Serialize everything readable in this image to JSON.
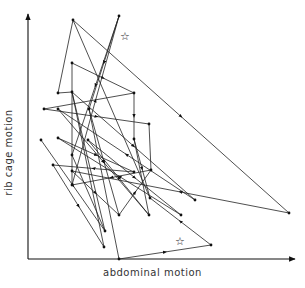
{
  "figure": {
    "x_axis_label": "abdominal motion",
    "y_axis_label": "rib cage motion",
    "star_markers": [
      {
        "x": 125,
        "y": 37,
        "symbol": "☆"
      },
      {
        "x": 180,
        "y": 242,
        "symbol": "☆"
      }
    ],
    "axes": {
      "origin": [
        28,
        259
      ],
      "x_end": [
        295,
        259
      ],
      "y_end": [
        28,
        14
      ]
    },
    "nodes": {
      "A": [
        73,
        20
      ],
      "B": [
        119,
        16
      ],
      "C": [
        58,
        93
      ],
      "D": [
        72,
        63
      ],
      "E": [
        72,
        92
      ],
      "F": [
        134,
        93
      ],
      "G": [
        44,
        109
      ],
      "H": [
        58,
        109
      ],
      "I": [
        89,
        109
      ],
      "J": [
        149,
        124
      ],
      "K": [
        41,
        140
      ],
      "L": [
        58,
        138
      ],
      "M": [
        88,
        140
      ],
      "N": [
        134,
        139
      ],
      "O": [
        53,
        165
      ],
      "P": [
        72,
        155
      ],
      "Q": [
        72,
        171
      ],
      "R": [
        134,
        172
      ],
      "S": [
        151,
        170
      ],
      "T": [
        72,
        185
      ],
      "U": [
        150,
        198
      ],
      "V": [
        195,
        200
      ],
      "W": [
        119,
        215
      ],
      "X": [
        149,
        215
      ],
      "Y": [
        181,
        215
      ],
      "Z": [
        105,
        231
      ],
      "AA": [
        289,
        213
      ],
      "AB": [
        104,
        247
      ],
      "AC": [
        211,
        245
      ],
      "AD": [
        119,
        259
      ]
    },
    "edges": [
      [
        "AD",
        "AC",
        true
      ],
      [
        "AC",
        "U",
        true
      ],
      [
        "U",
        "A",
        false
      ],
      [
        "A",
        "C",
        false
      ],
      [
        "C",
        "E",
        false
      ],
      [
        "A",
        "AA",
        true
      ],
      [
        "AA",
        "Q",
        true
      ],
      [
        "D",
        "F",
        true
      ],
      [
        "F",
        "N",
        true
      ],
      [
        "D",
        "T",
        false
      ],
      [
        "T",
        "B",
        true
      ],
      [
        "B",
        "P",
        true
      ],
      [
        "B",
        "I",
        true
      ],
      [
        "G",
        "J",
        true
      ],
      [
        "J",
        "S",
        false
      ],
      [
        "S",
        "T",
        true
      ],
      [
        "H",
        "X",
        true
      ],
      [
        "X",
        "M",
        true
      ],
      [
        "M",
        "Y",
        true
      ],
      [
        "Y",
        "L",
        true
      ],
      [
        "I",
        "AD",
        false
      ],
      [
        "I",
        "W",
        true
      ],
      [
        "W",
        "S",
        true
      ],
      [
        "K",
        "Z",
        true
      ],
      [
        "O",
        "AB",
        true
      ],
      [
        "AB",
        "E",
        false
      ],
      [
        "E",
        "V",
        true
      ],
      [
        "V",
        "H",
        true
      ],
      [
        "L",
        "R",
        true
      ],
      [
        "R",
        "O",
        true
      ],
      [
        "N",
        "X",
        false
      ],
      [
        "N",
        "U",
        true
      ],
      [
        "P",
        "Z",
        false
      ],
      [
        "Q",
        "W",
        true
      ],
      [
        "E",
        "Z",
        false
      ],
      [
        "G",
        "F",
        false
      ]
    ]
  }
}
